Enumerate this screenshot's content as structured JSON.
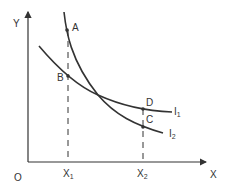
{
  "diagram": {
    "type": "indifference-curves",
    "axes": {
      "origin_label": "O",
      "x_label": "X",
      "y_label": "Y"
    },
    "ticks": [
      {
        "base": "X",
        "sub": "1"
      },
      {
        "base": "X",
        "sub": "2"
      }
    ],
    "curves": [
      {
        "base": "I",
        "sub": "1",
        "description": "flatter curve through B and D"
      },
      {
        "base": "I",
        "sub": "2",
        "description": "steeper curve through A and C"
      }
    ],
    "points": {
      "A": "A",
      "B": "B",
      "C": "C",
      "D": "D"
    },
    "colors": {
      "line": "#333333",
      "background": "#ffffff"
    }
  }
}
